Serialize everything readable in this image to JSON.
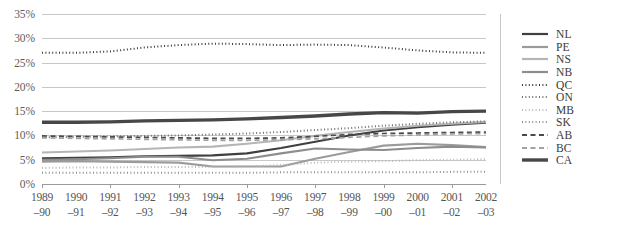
{
  "chart_data": {
    "type": "line",
    "title": "",
    "xlabel": "",
    "ylabel": "",
    "ylim": [
      0,
      35
    ],
    "ytick_values": [
      0,
      5,
      10,
      15,
      20,
      25,
      30,
      35
    ],
    "ytick_labels": [
      "0%",
      "5%",
      "10%",
      "15%",
      "20%",
      "25%",
      "30%",
      "35%"
    ],
    "grid": true,
    "legend_position": "right",
    "categories": [
      "1989–90",
      "1990–91",
      "1991–92",
      "1992–93",
      "1993–94",
      "1994–95",
      "1995–96",
      "1996–97",
      "1997–98",
      "1998–99",
      "1999–00",
      "2000–01",
      "2001–02",
      "2002–03"
    ],
    "categories_split": [
      {
        "top": "1989",
        "bottom": "–90"
      },
      {
        "top": "1990",
        "bottom": "–91"
      },
      {
        "top": "1991",
        "bottom": "–92"
      },
      {
        "top": "1992",
        "bottom": "–93"
      },
      {
        "top": "1993",
        "bottom": "–94"
      },
      {
        "top": "1994",
        "bottom": "–95"
      },
      {
        "top": "1995",
        "bottom": "–96"
      },
      {
        "top": "1996",
        "bottom": "–97"
      },
      {
        "top": "1997",
        "bottom": "–98"
      },
      {
        "top": "1998",
        "bottom": "–99"
      },
      {
        "top": "1999",
        "bottom": "–00"
      },
      {
        "top": "2000",
        "bottom": "–01"
      },
      {
        "top": "2001",
        "bottom": "–02"
      },
      {
        "top": "2002",
        "bottom": "–03"
      }
    ],
    "series": [
      {
        "name": "NL",
        "color": "#3f3f3f",
        "width": 2.1,
        "dash": "none",
        "values": [
          5.3,
          5.4,
          5.5,
          5.7,
          5.8,
          5.9,
          6.3,
          7.4,
          8.7,
          10.0,
          11.0,
          11.7,
          12.2,
          12.6
        ]
      },
      {
        "name": "PE",
        "color": "#9b9b9b",
        "width": 2.1,
        "dash": "none",
        "values": [
          4.6,
          4.7,
          4.6,
          4.5,
          4.4,
          3.6,
          3.6,
          3.6,
          5.2,
          6.6,
          7.9,
          8.3,
          8.0,
          7.6
        ]
      },
      {
        "name": "NS",
        "color": "#b5b5b5",
        "width": 2.1,
        "dash": "none",
        "values": [
          6.5,
          6.7,
          6.9,
          7.2,
          7.5,
          7.7,
          8.3,
          9.0,
          9.9,
          10.7,
          11.4,
          12.0,
          12.4,
          12.8
        ]
      },
      {
        "name": "NB",
        "color": "#8d8d8d",
        "width": 2.1,
        "dash": "none",
        "values": [
          5.0,
          5.1,
          5.3,
          5.6,
          5.6,
          4.9,
          5.2,
          6.3,
          7.3,
          7.1,
          7.0,
          7.4,
          7.7,
          7.5
        ]
      },
      {
        "name": "QC",
        "color": "#3a3a3a",
        "width": 2.0,
        "dash": "1,2.4",
        "values": [
          27.0,
          27.0,
          27.3,
          28.1,
          28.6,
          28.9,
          28.8,
          28.6,
          28.7,
          28.6,
          28.1,
          27.5,
          27.1,
          27.0
        ]
      },
      {
        "name": "ON",
        "color": "#6f6f6f",
        "width": 2.0,
        "dash": "1,2.4",
        "values": [
          9.6,
          9.7,
          9.8,
          9.9,
          10.0,
          10.2,
          10.4,
          10.7,
          11.1,
          11.5,
          12.0,
          12.4,
          12.7,
          12.9
        ]
      },
      {
        "name": "MB",
        "color": "#b8b8b8",
        "width": 2.0,
        "dash": "1,2.4",
        "values": [
          3.3,
          3.4,
          3.4,
          3.5,
          3.5,
          3.5,
          3.6,
          3.9,
          4.4,
          4.6,
          4.7,
          4.9,
          5.0,
          5.1
        ]
      },
      {
        "name": "SK",
        "color": "#8f8f8f",
        "width": 2.0,
        "dash": "1,2.4",
        "values": [
          2.3,
          2.3,
          2.3,
          2.3,
          2.3,
          2.3,
          2.3,
          2.4,
          2.4,
          2.4,
          2.4,
          2.4,
          2.5,
          2.5
        ]
      },
      {
        "name": "AB",
        "color": "#4a4a4a",
        "width": 1.7,
        "dash": "5,3.5",
        "values": [
          9.9,
          9.8,
          9.7,
          9.6,
          9.5,
          9.4,
          9.4,
          9.5,
          9.8,
          10.2,
          10.4,
          10.5,
          10.6,
          10.7
        ]
      },
      {
        "name": "BC",
        "color": "#a2a2a2",
        "width": 1.7,
        "dash": "5,3.5",
        "values": [
          9.5,
          9.4,
          9.3,
          9.2,
          9.1,
          9.0,
          9.0,
          9.1,
          9.3,
          9.6,
          9.9,
          10.1,
          10.3,
          10.4
        ]
      },
      {
        "name": "CA",
        "color": "#474747",
        "width": 3.4,
        "dash": "none",
        "values": [
          12.7,
          12.7,
          12.8,
          13.0,
          13.1,
          13.2,
          13.4,
          13.7,
          14.0,
          14.4,
          14.7,
          14.6,
          14.9,
          15.0
        ]
      }
    ]
  },
  "legend": {
    "items": [
      {
        "label": "NL"
      },
      {
        "label": "PE"
      },
      {
        "label": "NS"
      },
      {
        "label": "NB"
      },
      {
        "label": "QC"
      },
      {
        "label": "ON"
      },
      {
        "label": "MB"
      },
      {
        "label": "SK"
      },
      {
        "label": "AB"
      },
      {
        "label": "BC"
      },
      {
        "label": "CA"
      }
    ]
  }
}
